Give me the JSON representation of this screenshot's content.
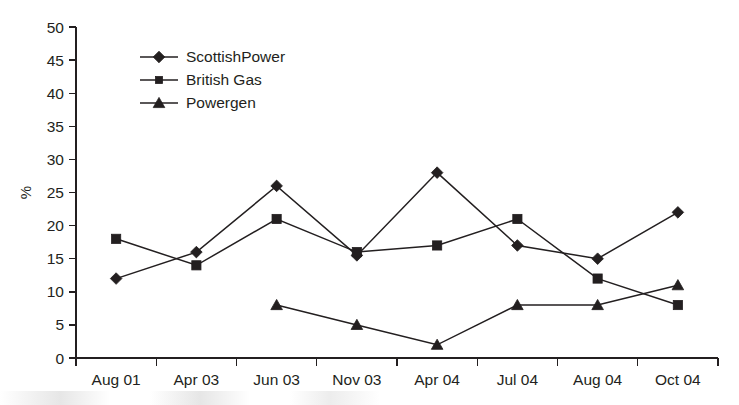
{
  "chart_data": {
    "type": "line",
    "title": "",
    "subtitle": "",
    "xlabel": "",
    "ylabel": "%",
    "categories": [
      "Aug 01",
      "Apr 03",
      "Jun 03",
      "Nov 03",
      "Apr 04",
      "Jul 04",
      "Aug 04",
      "Oct 04"
    ],
    "ylim": [
      0,
      50
    ],
    "ytick_step": 5,
    "yticks": [
      "0",
      "5",
      "10",
      "15",
      "20",
      "25",
      "30",
      "35",
      "40",
      "45",
      "50"
    ],
    "grid": false,
    "legend_position": "inside-top-left",
    "series": [
      {
        "name": "ScottishPower",
        "marker": "diamond",
        "color": "#231f20",
        "values": [
          12,
          16,
          26,
          15.5,
          28,
          17,
          15,
          22
        ]
      },
      {
        "name": "British Gas",
        "marker": "square",
        "color": "#231f20",
        "values": [
          18,
          14,
          21,
          16,
          17,
          21,
          12,
          8
        ]
      },
      {
        "name": "Powergen",
        "marker": "triangle",
        "color": "#231f20",
        "values": [
          null,
          null,
          8,
          5,
          2,
          8,
          8,
          11
        ]
      }
    ]
  },
  "legend": {
    "entries": [
      {
        "label": "ScottishPower"
      },
      {
        "label": "British Gas"
      },
      {
        "label": "Powergen"
      }
    ]
  }
}
